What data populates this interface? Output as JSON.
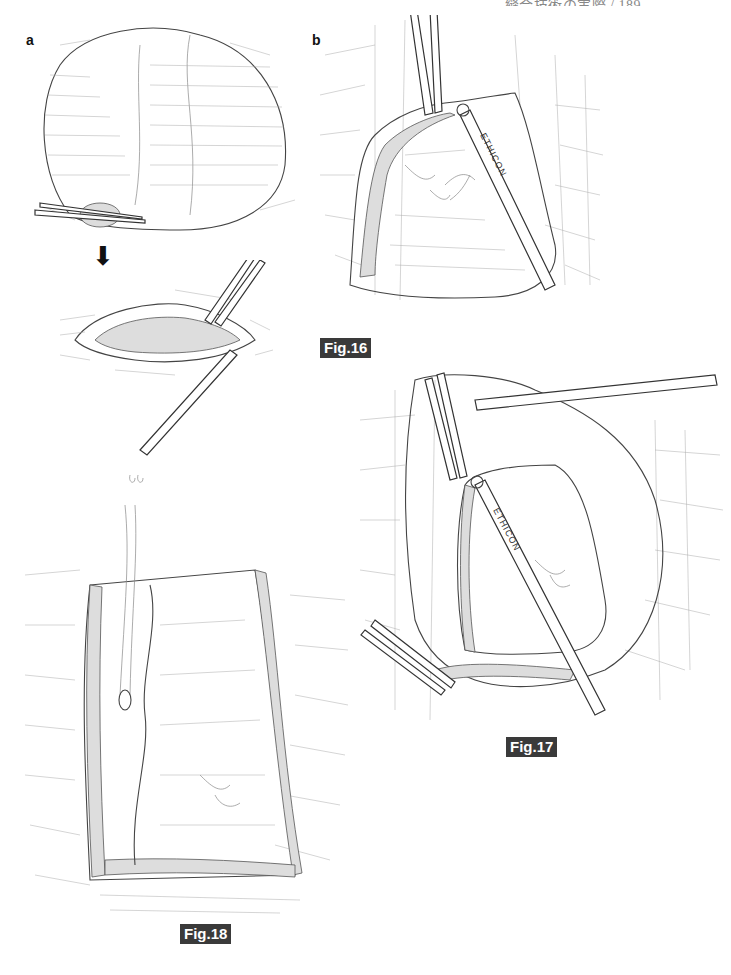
{
  "page_header": {
    "text": "…縫合技術の実際 / 189",
    "page_number": "189"
  },
  "panels": {
    "a": "a",
    "b": "b"
  },
  "figures": [
    {
      "id": "fig16",
      "label": "Fig.16",
      "instrument_text": "ETHICON"
    },
    {
      "id": "fig17",
      "label": "Fig.17",
      "instrument_text": "ETHICON"
    },
    {
      "id": "fig18",
      "label": "Fig.18"
    }
  ],
  "arrow": {
    "direction": "down",
    "glyph": "⬇"
  },
  "colors": {
    "label_bg": "#3a3a3a",
    "label_text": "#ffffff",
    "line_art": "#444444"
  }
}
